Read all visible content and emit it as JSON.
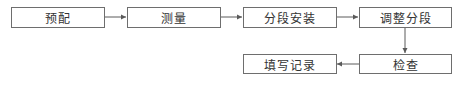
{
  "diagram": {
    "type": "flowchart",
    "nodes": [
      {
        "id": "n1",
        "label": "预配"
      },
      {
        "id": "n2",
        "label": "测量"
      },
      {
        "id": "n3",
        "label": "分段安装"
      },
      {
        "id": "n4",
        "label": "调整分段"
      },
      {
        "id": "n5",
        "label": "检查"
      },
      {
        "id": "n6",
        "label": "填写记录"
      }
    ],
    "edges": [
      {
        "from": "n1",
        "to": "n2"
      },
      {
        "from": "n2",
        "to": "n3"
      },
      {
        "from": "n3",
        "to": "n4"
      },
      {
        "from": "n4",
        "to": "n5"
      },
      {
        "from": "n5",
        "to": "n6"
      }
    ],
    "colors": {
      "line": "#5a5a5a",
      "border": "#6e6e6e",
      "text": "#333333"
    }
  }
}
